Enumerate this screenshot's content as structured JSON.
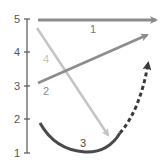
{
  "axis": {
    "ticks": [
      {
        "label": "5",
        "y": 19
      },
      {
        "label": "4",
        "y": 52
      },
      {
        "label": "3",
        "y": 86
      },
      {
        "label": "2",
        "y": 119
      },
      {
        "label": "1",
        "y": 153
      }
    ]
  },
  "arrows": [
    {
      "id": "1",
      "label": "1",
      "color": "#8c8c8c",
      "style": "solid",
      "from": [
        38,
        20
      ],
      "to": [
        160,
        20
      ]
    },
    {
      "id": "2",
      "label": "2",
      "color": "#8c8c8c",
      "style": "solid",
      "from": [
        38,
        83
      ],
      "to": [
        150,
        34
      ]
    },
    {
      "id": "3",
      "label": "3",
      "color": "#4a4a4a",
      "style": "solid-then-dashed",
      "from": [
        40,
        123
      ],
      "to": [
        150,
        59
      ]
    },
    {
      "id": "4",
      "label": "4",
      "color": "#c4c4c4",
      "style": "solid",
      "from": [
        37,
        28
      ],
      "to": [
        110,
        138
      ]
    }
  ],
  "colors": {
    "axis": "#555555",
    "arrow1": "#8c8c8c",
    "arrow2": "#8c8c8c",
    "arrow3": "#4a4a4a",
    "arrow4": "#c4c4c4"
  }
}
